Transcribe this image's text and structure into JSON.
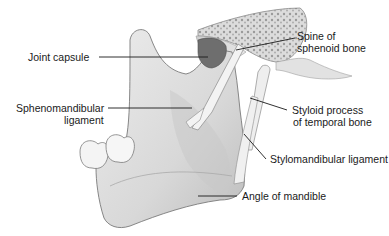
{
  "diagram": {
    "labels": [
      {
        "id": "joint-capsule",
        "lines": [
          "Joint capsule"
        ]
      },
      {
        "id": "sphenomandibular-ligament",
        "lines": [
          "Sphenomandibular",
          "ligament"
        ]
      },
      {
        "id": "spine-of-sphenoid-bone",
        "lines": [
          "Spine of",
          "sphenoid bone"
        ]
      },
      {
        "id": "styloid-process",
        "lines": [
          "Styloid process",
          "of temporal bone"
        ]
      },
      {
        "id": "stylomandibular-ligament",
        "lines": [
          "Stylomandibular ligament"
        ]
      },
      {
        "id": "angle-of-mandible",
        "lines": [
          "Angle of mandible"
        ]
      }
    ],
    "colors": {
      "bone": "#e3e3e3",
      "bone_shade": "#b9b9b9",
      "outline": "#7a7a7a",
      "capsule": "#6e6e6e",
      "ligament": "#f2f2f2",
      "leader": "#1a1a1a"
    }
  }
}
